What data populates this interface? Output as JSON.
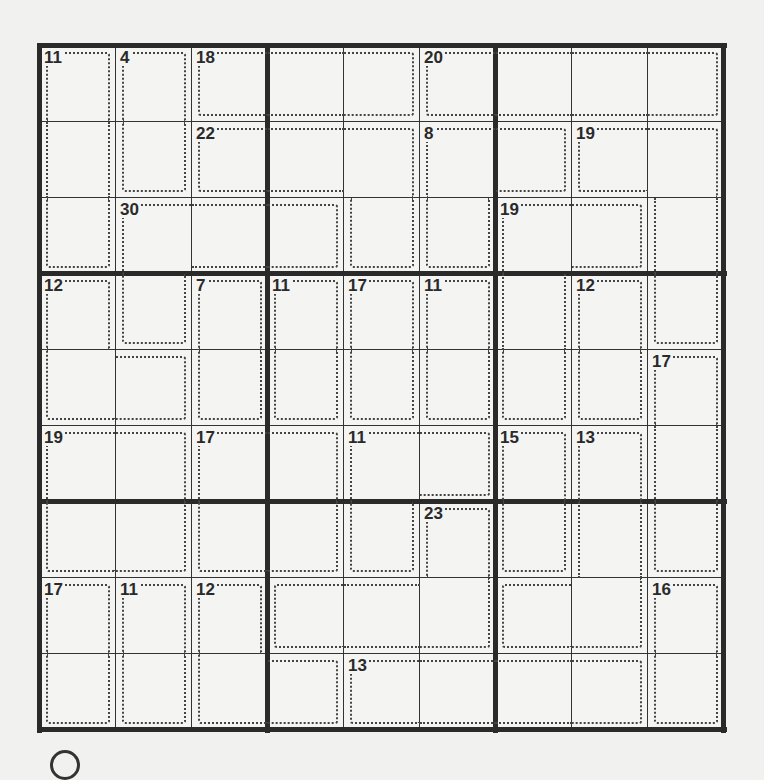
{
  "puzzle": {
    "type": "killer-sudoku",
    "size": 9,
    "colors": {
      "grid": "#2a2a2a",
      "background": "#f4f4f2",
      "cage": "#444444"
    },
    "cages": [
      {
        "sum": "11",
        "cells": [
          [
            0,
            0
          ],
          [
            1,
            0
          ],
          [
            2,
            0
          ]
        ]
      },
      {
        "sum": "4",
        "cells": [
          [
            0,
            1
          ],
          [
            1,
            1
          ]
        ]
      },
      {
        "sum": "18",
        "cells": [
          [
            0,
            2
          ],
          [
            0,
            3
          ],
          [
            0,
            4
          ]
        ]
      },
      {
        "sum": "20",
        "cells": [
          [
            0,
            5
          ],
          [
            0,
            6
          ],
          [
            0,
            7
          ],
          [
            0,
            8
          ]
        ]
      },
      {
        "sum": "22",
        "cells": [
          [
            1,
            2
          ],
          [
            1,
            3
          ],
          [
            1,
            4
          ],
          [
            2,
            4
          ]
        ]
      },
      {
        "sum": "8",
        "cells": [
          [
            1,
            5
          ],
          [
            1,
            6
          ],
          [
            2,
            5
          ]
        ]
      },
      {
        "sum": "19",
        "cells": [
          [
            1,
            7
          ],
          [
            1,
            8
          ],
          [
            2,
            8
          ],
          [
            3,
            8
          ]
        ]
      },
      {
        "sum": "30",
        "cells": [
          [
            2,
            1
          ],
          [
            2,
            2
          ],
          [
            2,
            3
          ],
          [
            3,
            1
          ]
        ]
      },
      {
        "sum": "19",
        "cells": [
          [
            2,
            6
          ],
          [
            2,
            7
          ],
          [
            3,
            6
          ],
          [
            4,
            6
          ]
        ]
      },
      {
        "sum": "12",
        "cells": [
          [
            3,
            0
          ],
          [
            4,
            0
          ],
          [
            4,
            1
          ]
        ]
      },
      {
        "sum": "7",
        "cells": [
          [
            3,
            2
          ],
          [
            4,
            2
          ]
        ]
      },
      {
        "sum": "11",
        "cells": [
          [
            3,
            3
          ],
          [
            4,
            3
          ]
        ]
      },
      {
        "sum": "17",
        "cells": [
          [
            3,
            4
          ],
          [
            4,
            4
          ]
        ]
      },
      {
        "sum": "11",
        "cells": [
          [
            3,
            5
          ],
          [
            4,
            5
          ]
        ]
      },
      {
        "sum": "12",
        "cells": [
          [
            3,
            7
          ],
          [
            4,
            7
          ]
        ]
      },
      {
        "sum": "17",
        "cells": [
          [
            4,
            8
          ],
          [
            5,
            8
          ],
          [
            6,
            8
          ]
        ]
      },
      {
        "sum": "19",
        "cells": [
          [
            5,
            0
          ],
          [
            5,
            1
          ],
          [
            6,
            0
          ],
          [
            6,
            1
          ]
        ]
      },
      {
        "sum": "17",
        "cells": [
          [
            5,
            2
          ],
          [
            5,
            3
          ],
          [
            6,
            2
          ],
          [
            6,
            3
          ]
        ]
      },
      {
        "sum": "11",
        "cells": [
          [
            5,
            4
          ],
          [
            5,
            5
          ],
          [
            6,
            4
          ]
        ]
      },
      {
        "sum": "15",
        "cells": [
          [
            5,
            6
          ],
          [
            6,
            6
          ]
        ]
      },
      {
        "sum": "13",
        "cells": [
          [
            5,
            7
          ],
          [
            6,
            7
          ],
          [
            7,
            6
          ],
          [
            7,
            7
          ]
        ]
      },
      {
        "sum": "23",
        "cells": [
          [
            6,
            5
          ],
          [
            7,
            3
          ],
          [
            7,
            4
          ],
          [
            7,
            5
          ]
        ]
      },
      {
        "sum": "17",
        "cells": [
          [
            7,
            0
          ],
          [
            8,
            0
          ]
        ]
      },
      {
        "sum": "11",
        "cells": [
          [
            7,
            1
          ],
          [
            8,
            1
          ]
        ]
      },
      {
        "sum": "12",
        "cells": [
          [
            7,
            2
          ],
          [
            8,
            2
          ],
          [
            8,
            3
          ]
        ]
      },
      {
        "sum": "16",
        "cells": [
          [
            7,
            8
          ],
          [
            8,
            8
          ]
        ]
      },
      {
        "sum": "13",
        "cells": [
          [
            8,
            4
          ],
          [
            8,
            5
          ],
          [
            8,
            6
          ],
          [
            8,
            7
          ]
        ]
      }
    ]
  }
}
